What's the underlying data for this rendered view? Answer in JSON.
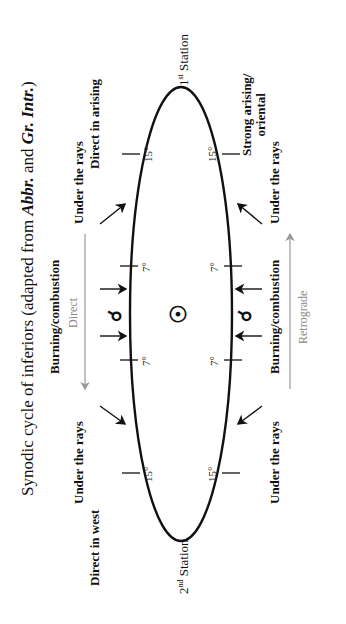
{
  "title": {
    "prefix": "Synodic cycle of inferiors (adapted from ",
    "abbr": "Abbr.",
    "mid": " and ",
    "grintr": "Gr. Intr.",
    "suffix": ")"
  },
  "motion": {
    "direct": "Direct",
    "retrograde": "Retrograde"
  },
  "stations": {
    "first_num": "1",
    "first_sup": "st",
    "first_label": " Station",
    "second_num": "2",
    "second_sup": "nd",
    "second_label": " Station"
  },
  "phases": {
    "direct_in_arising": "Direct in arising",
    "direct_in_west": "Direct in west",
    "strong_arising_1": "Strong arising/",
    "strong_arising_2": "oriental",
    "under_rays_top_right": "Under the rays",
    "under_rays_top_left": "Under the rays",
    "under_rays_bottom_right": "Under the rays",
    "under_rays_bottom_left": "Under the rays",
    "burning_top": "Burning/combustion",
    "burning_bottom": "Burning/combustion"
  },
  "degrees": {
    "d15": "15°",
    "d7": "7°"
  },
  "symbols": {
    "sun": "☉",
    "conjunction": "☌"
  },
  "colors": {
    "ink": "#111111",
    "gray_arrow": "#999999"
  }
}
